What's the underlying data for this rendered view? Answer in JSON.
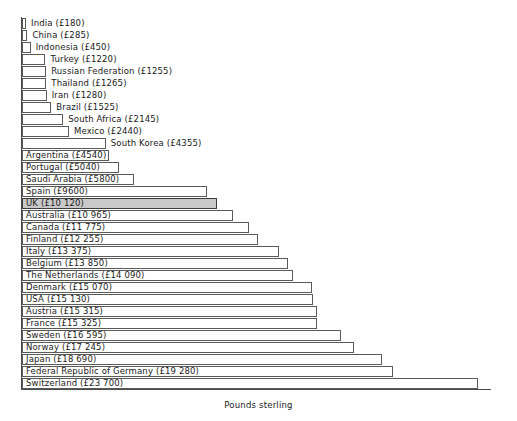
{
  "chart_data": {
    "type": "bar",
    "orientation": "horizontal",
    "title": "",
    "subtitle": "",
    "xlabel": "Pounds sterling",
    "ylabel": "",
    "grid": false,
    "legend": null,
    "xlim": [
      0,
      23700
    ],
    "highlight_category": "UK",
    "highlight_color": "#c9c9c9",
    "bar_fill_color": "#ffffff",
    "bar_border_color": "#5a5a5a",
    "axis_color": "#4a4a4a",
    "currency_symbol": "£",
    "categories": [
      "India",
      "China",
      "Indonesia",
      "Turkey",
      "Russian Federation",
      "Thailand",
      "Iran",
      "Brazil",
      "South Africa",
      "Mexico",
      "South Korea",
      "Argentina",
      "Portugal",
      "Saudi Arabia",
      "Spain",
      "UK",
      "Australia",
      "Canada",
      "Finland",
      "Italy",
      "Belgium",
      "The Netherlands",
      "Denmark",
      "USA",
      "Austria",
      "France",
      "Sweden",
      "Norway",
      "Japan",
      "Federal Republic of Germany",
      "Switzerland"
    ],
    "values": [
      180,
      285,
      450,
      1220,
      1255,
      1265,
      1280,
      1525,
      2145,
      2440,
      4355,
      4540,
      5040,
      5800,
      9600,
      10120,
      10965,
      11775,
      12255,
      13375,
      13850,
      14090,
      15070,
      15130,
      15315,
      15325,
      16595,
      17245,
      18690,
      19280,
      23700
    ],
    "bars": [
      {
        "label": "India (£180)",
        "value": 180,
        "label_position": "outside",
        "highlight": false
      },
      {
        "label": "China (£285)",
        "value": 285,
        "label_position": "outside",
        "highlight": false
      },
      {
        "label": "Indonesia (£450)",
        "value": 450,
        "label_position": "outside",
        "highlight": false
      },
      {
        "label": "Turkey (£1220)",
        "value": 1220,
        "label_position": "outside",
        "highlight": false
      },
      {
        "label": "Russian Federation (£1255)",
        "value": 1255,
        "label_position": "outside",
        "highlight": false
      },
      {
        "label": "Thailand (£1265)",
        "value": 1265,
        "label_position": "outside",
        "highlight": false
      },
      {
        "label": "Iran (£1280)",
        "value": 1280,
        "label_position": "outside",
        "highlight": false
      },
      {
        "label": "Brazil (£1525)",
        "value": 1525,
        "label_position": "outside",
        "highlight": false
      },
      {
        "label": "South Africa (£2145)",
        "value": 2145,
        "label_position": "outside",
        "highlight": false
      },
      {
        "label": "Mexico (£2440)",
        "value": 2440,
        "label_position": "outside",
        "highlight": false
      },
      {
        "label": "South Korea (£4355)",
        "value": 4355,
        "label_position": "outside",
        "highlight": false
      },
      {
        "label": "Argentina (£4540)",
        "value": 4540,
        "label_position": "inside",
        "highlight": false
      },
      {
        "label": "Portugal (£5040)",
        "value": 5040,
        "label_position": "inside",
        "highlight": false
      },
      {
        "label": "Saudi Arabia (£5800)",
        "value": 5800,
        "label_position": "inside",
        "highlight": false
      },
      {
        "label": "Spain (£9600)",
        "value": 9600,
        "label_position": "inside",
        "highlight": false
      },
      {
        "label": "UK (£10 120)",
        "value": 10120,
        "label_position": "inside",
        "highlight": true
      },
      {
        "label": "Australia (£10 965)",
        "value": 10965,
        "label_position": "inside",
        "highlight": false
      },
      {
        "label": "Canada (£11 775)",
        "value": 11775,
        "label_position": "inside",
        "highlight": false
      },
      {
        "label": "Finland (£12 255)",
        "value": 12255,
        "label_position": "inside",
        "highlight": false
      },
      {
        "label": "Italy (£13 375)",
        "value": 13375,
        "label_position": "inside",
        "highlight": false
      },
      {
        "label": "Belgium (£13 850)",
        "value": 13850,
        "label_position": "inside",
        "highlight": false
      },
      {
        "label": "The Netherlands (£14 090)",
        "value": 14090,
        "label_position": "inside",
        "highlight": false
      },
      {
        "label": "Denmark (£15 070)",
        "value": 15070,
        "label_position": "inside",
        "highlight": false
      },
      {
        "label": "USA (£15 130)",
        "value": 15130,
        "label_position": "inside",
        "highlight": false
      },
      {
        "label": "Austria (£15 315)",
        "value": 15315,
        "label_position": "inside",
        "highlight": false
      },
      {
        "label": "France (£15 325)",
        "value": 15325,
        "label_position": "inside",
        "highlight": false
      },
      {
        "label": "Sweden (£16 595)",
        "value": 16595,
        "label_position": "inside",
        "highlight": false
      },
      {
        "label": "Norway (£17 245)",
        "value": 17245,
        "label_position": "inside",
        "highlight": false
      },
      {
        "label": "Japan (£18 690)",
        "value": 18690,
        "label_position": "inside",
        "highlight": false
      },
      {
        "label": "Federal Republic of Germany (£19 280)",
        "value": 19280,
        "label_position": "inside",
        "highlight": false
      },
      {
        "label": "Switzerland (£23 700)",
        "value": 23700,
        "label_position": "inside",
        "highlight": false
      }
    ]
  },
  "layout": {
    "bar_origin_x": 22,
    "first_bar_y": 18,
    "row_pitch": 12.0,
    "bar_height": 11,
    "px_per_pound": 0.019240506,
    "baseline_y": 389
  }
}
